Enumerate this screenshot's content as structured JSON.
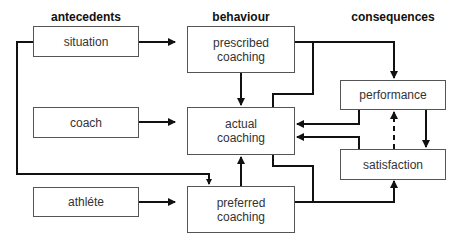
{
  "headings": {
    "antecedents": "antecedents",
    "behaviour": "behaviour",
    "consequences": "consequences"
  },
  "boxes": {
    "situation": "situation",
    "coach": "coach",
    "athlete": "athléte",
    "prescribed": "prescribed\ncoaching",
    "actual": "actual\ncoaching",
    "preferred": "preferred\ncoaching",
    "performance": "performance",
    "satisfaction": "satisfaction"
  },
  "colors": {
    "line": "#111111",
    "box_border": "#555555",
    "text": "#333333"
  }
}
